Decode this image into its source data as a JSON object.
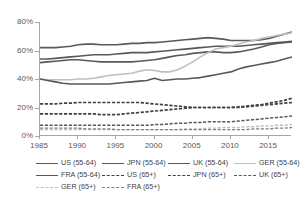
{
  "chart_data": {
    "type": "line",
    "title": "",
    "xlabel": "",
    "ylabel": "",
    "xlim": [
      1985,
      2018
    ],
    "ylim": [
      0,
      0.8
    ],
    "grid": false,
    "legend_position": "bottom",
    "y_ticks": [
      "0%",
      "20%",
      "40%",
      "60%",
      "80%"
    ],
    "y_tick_values": [
      0,
      20,
      40,
      60,
      80
    ],
    "x_ticks": [
      "1985",
      "1990",
      "1995",
      "2000",
      "2005",
      "2010",
      "2015"
    ],
    "x_tick_values": [
      1985,
      1990,
      1995,
      2000,
      2005,
      2010,
      2015
    ],
    "x": [
      1985,
      1986,
      1987,
      1988,
      1989,
      1990,
      1991,
      1992,
      1993,
      1994,
      1995,
      1996,
      1997,
      1998,
      1999,
      2000,
      2001,
      2002,
      2003,
      2004,
      2005,
      2006,
      2007,
      2008,
      2009,
      2010,
      2011,
      2012,
      2013,
      2014,
      2015,
      2016,
      2017,
      2018
    ],
    "series": [
      {
        "name": "US (55-64)",
        "style": "solid",
        "color": "#595959",
        "width": 1.6,
        "values": [
          62,
          62,
          62,
          62.5,
          63,
          64,
          64.5,
          64.5,
          64,
          64,
          64,
          64.5,
          65,
          65,
          65.5,
          65.5,
          66,
          66.5,
          67,
          67.5,
          68,
          68.5,
          69,
          68.5,
          68,
          67,
          67,
          67,
          67,
          67.5,
          68.5,
          70,
          71.5,
          73
        ]
      },
      {
        "name": "JPN (55-64)",
        "style": "solid",
        "color": "#595959",
        "width": 1.6,
        "values": [
          54,
          54,
          54.5,
          55,
          55.5,
          56,
          56.5,
          57,
          57,
          57,
          57.5,
          58,
          58.5,
          58.5,
          58.5,
          59,
          59.5,
          60,
          60.5,
          61,
          61.5,
          62,
          62.5,
          63,
          63,
          63,
          63,
          63.5,
          64,
          64.5,
          65,
          65.5,
          66,
          66.5
        ]
      },
      {
        "name": "UK (55-64)",
        "style": "solid",
        "color": "#595959",
        "width": 1.6,
        "values": [
          51.5,
          52,
          52.5,
          53,
          53.5,
          53.5,
          53,
          52.5,
          52,
          52,
          52,
          52,
          52,
          52.5,
          53,
          53.5,
          54.5,
          55.5,
          56.5,
          57,
          58,
          58.5,
          59,
          59,
          58.5,
          58.5,
          59,
          60,
          61,
          62.5,
          64,
          65,
          65.5,
          66
        ]
      },
      {
        "name": "GER (55-64)",
        "style": "solid",
        "color": "#bfbfbf",
        "width": 1.6,
        "values": [
          40,
          39.5,
          39.5,
          39.5,
          39.5,
          40,
          40,
          40.5,
          41.5,
          42.5,
          43,
          43.5,
          44,
          45.5,
          46.5,
          46,
          45,
          45,
          46.5,
          49,
          52,
          55.5,
          58.5,
          61,
          62,
          63,
          64.5,
          66,
          67,
          68.5,
          69.5,
          70.5,
          71.5,
          72.5
        ]
      },
      {
        "name": "FRA (55-64)",
        "style": "solid",
        "color": "#595959",
        "width": 1.6,
        "values": [
          40,
          39,
          38,
          37,
          36.5,
          36.5,
          36.5,
          36.5,
          36.5,
          36.5,
          37,
          37.5,
          38,
          38.5,
          39,
          40.5,
          39,
          39.5,
          40,
          40,
          40.5,
          41,
          42,
          43,
          44,
          45,
          47,
          48.5,
          49.5,
          50.5,
          51.5,
          52.5,
          54,
          55.5
        ]
      },
      {
        "name": "US (65+)",
        "style": "dashed",
        "color": "#404040",
        "width": 1.7,
        "values": [
          22.5,
          22.5,
          22.5,
          23,
          23,
          23.5,
          23.5,
          23.5,
          23.5,
          23.5,
          23.5,
          23.5,
          23.5,
          23.5,
          23,
          22.5,
          22,
          21.5,
          21,
          20.5,
          20,
          20,
          20,
          20,
          20,
          20,
          20.5,
          21,
          21.5,
          22,
          23,
          24,
          25,
          26.5
        ]
      },
      {
        "name": "JPN (65+)",
        "style": "dashed",
        "color": "#404040",
        "width": 1.7,
        "values": [
          15.5,
          15.5,
          15.5,
          15.5,
          15.5,
          15.5,
          15.5,
          15.5,
          15,
          15,
          15,
          15.5,
          16,
          16.5,
          17,
          17.5,
          18,
          18.5,
          19,
          19.5,
          20,
          20,
          20,
          20,
          20,
          20,
          20,
          20.5,
          21,
          21.5,
          22,
          22.5,
          23,
          23.5
        ]
      },
      {
        "name": "UK (65+)",
        "style": "dashed",
        "color": "#595959",
        "width": 1.5,
        "values": [
          7.5,
          7.5,
          7.5,
          7.5,
          7.5,
          7.5,
          7.5,
          7.5,
          7.5,
          7.5,
          7.5,
          7.5,
          7.5,
          7.5,
          7.5,
          8,
          8,
          8.5,
          9,
          9,
          9.5,
          9.5,
          10,
          10,
          10,
          10,
          10.5,
          11,
          11.5,
          12,
          12.5,
          13,
          13.5,
          14
        ]
      },
      {
        "name": "GER (65+)",
        "style": "dashed",
        "color": "#bfbfbf",
        "width": 1.4,
        "values": [
          4.5,
          4.5,
          4.5,
          4.5,
          4.5,
          4.5,
          4.5,
          4.5,
          4.5,
          4.5,
          4.5,
          4.5,
          4.5,
          4.5,
          4.5,
          4.5,
          4.5,
          4.5,
          4.5,
          5,
          5,
          5,
          5.5,
          5.5,
          6,
          6,
          6,
          6.5,
          6.5,
          7,
          7,
          7.5,
          7.5,
          8
        ]
      },
      {
        "name": "FRA (65+)",
        "style": "dashed",
        "color": "#808080",
        "width": 1.4,
        "values": [
          5.5,
          5.5,
          5.5,
          5.5,
          5.5,
          5.5,
          5,
          5,
          5,
          5,
          4.5,
          4.5,
          4.5,
          4.5,
          4.5,
          4.5,
          4.5,
          4.5,
          4.5,
          4.5,
          4.5,
          4.5,
          4.5,
          4.5,
          4.5,
          4.5,
          4.5,
          4.5,
          5,
          5,
          5,
          5.5,
          5.5,
          6
        ]
      }
    ]
  },
  "legend": {
    "rows": [
      [
        {
          "label": "US (55-64)",
          "style": "solid",
          "color": "#595959",
          "width": 1.8
        },
        {
          "label": "JPN (55-64)",
          "style": "solid",
          "color": "#595959",
          "width": 1.8
        },
        {
          "label": "UK (55-64)",
          "style": "solid",
          "color": "#595959",
          "width": 1.8
        },
        {
          "label": "GER (55-64)",
          "style": "solid",
          "color": "#bfbfbf",
          "width": 1.8
        }
      ],
      [
        {
          "label": "FRA (55-64)",
          "style": "solid",
          "color": "#595959",
          "width": 1.8
        },
        {
          "label": "US (65+)",
          "style": "dashed",
          "color": "#404040",
          "width": 1.8
        },
        {
          "label": "JPN (65+)",
          "style": "dashed",
          "color": "#404040",
          "width": 1.8
        },
        {
          "label": "UK (65+)",
          "style": "dashed",
          "color": "#595959",
          "width": 1.6
        }
      ],
      [
        {
          "label": "GER (65+)",
          "style": "dashed",
          "color": "#bfbfbf",
          "width": 1.5
        },
        {
          "label": "FRA (65+)",
          "style": "dashed",
          "color": "#808080",
          "width": 1.5
        }
      ]
    ]
  },
  "axes": {
    "y_labels": [
      "80%",
      "60%",
      "40%",
      "20%",
      "0%"
    ],
    "x_labels": [
      "1985",
      "1990",
      "1995",
      "2000",
      "2005",
      "2010",
      "2015"
    ]
  }
}
